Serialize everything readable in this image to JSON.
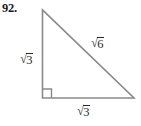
{
  "figure": {
    "problem_number": "92.",
    "stroke_color": "#808080",
    "text_color": "#2b2b2b",
    "background_color": "#ffffff"
  },
  "triangle": {
    "vertices": {
      "apex": {
        "x": 42,
        "y": 10
      },
      "bottom_left": {
        "x": 42,
        "y": 98
      },
      "bottom_right": {
        "x": 134,
        "y": 98
      }
    },
    "right_angle_marker": {
      "at": "bottom_left",
      "size": 9
    }
  },
  "labels": {
    "left_leg": {
      "radical": "√",
      "radicand": "3",
      "position": "left-of-vertical-leg"
    },
    "hypotenuse": {
      "radical": "√",
      "radicand": "6",
      "position": "above-hypotenuse"
    },
    "bottom_leg": {
      "radical": "√",
      "radicand": "3",
      "position": "below-horizontal-leg"
    }
  }
}
